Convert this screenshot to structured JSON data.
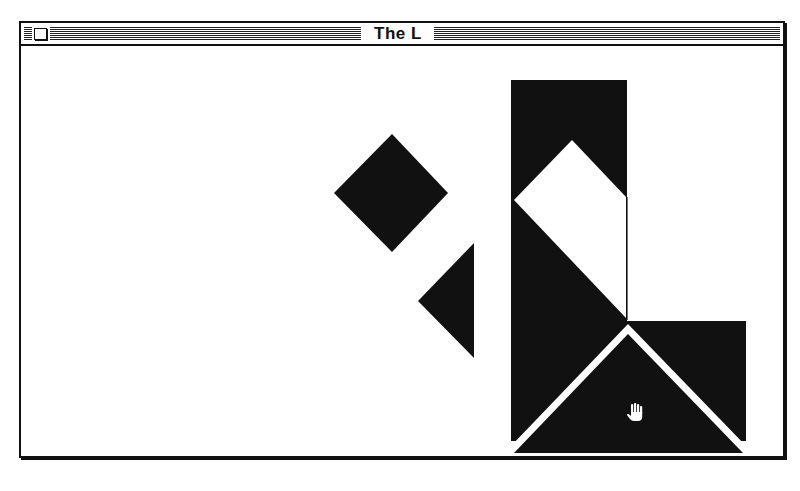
{
  "window": {
    "title": "The L",
    "close_box_icon": "close-box-icon"
  },
  "game": {
    "puzzle_name": "The L",
    "pieces": [
      {
        "id": "square",
        "type": "square",
        "color": "#111111",
        "state": "unplaced"
      },
      {
        "id": "small-triangle",
        "type": "triangle",
        "color": "#111111",
        "state": "unplaced"
      },
      {
        "id": "silhouette",
        "type": "target-silhouette",
        "color": "#111111",
        "state": "target"
      },
      {
        "id": "large-triangle",
        "type": "triangle",
        "color": "#111111",
        "state": "placed"
      }
    ],
    "cursor": "hand-cursor-icon"
  },
  "colors": {
    "piece": "#111111",
    "background": "#ffffff",
    "frame": "#111111"
  }
}
